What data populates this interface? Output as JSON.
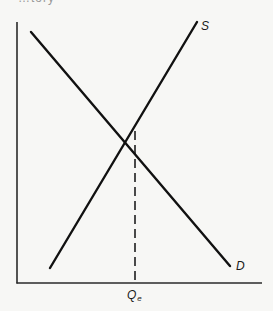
{
  "figure": {
    "top_fragment": "…tory",
    "curves": {
      "supply_label": "S",
      "demand_label": "D"
    },
    "axis": {
      "x_tick_label": "Q",
      "x_tick_subscript": "e"
    },
    "colors": {
      "background": "#f7f7f5",
      "ink": "#1a1a1a"
    }
  },
  "diagram_data": {
    "type": "supply-demand",
    "axes": {
      "x": "quantity (unlabeled)",
      "y": "price (unlabeled)"
    },
    "lines": [
      {
        "name": "D",
        "from": [
          31,
          32
        ],
        "to": [
          230,
          266
        ],
        "slope": "downward"
      },
      {
        "name": "S",
        "from": [
          50,
          268
        ],
        "to": [
          197,
          22
        ],
        "slope": "upward"
      }
    ],
    "equilibrium": {
      "point": [
        135,
        129
      ],
      "x_label": "Qe",
      "dashed_drop_to_x_axis": true
    }
  }
}
